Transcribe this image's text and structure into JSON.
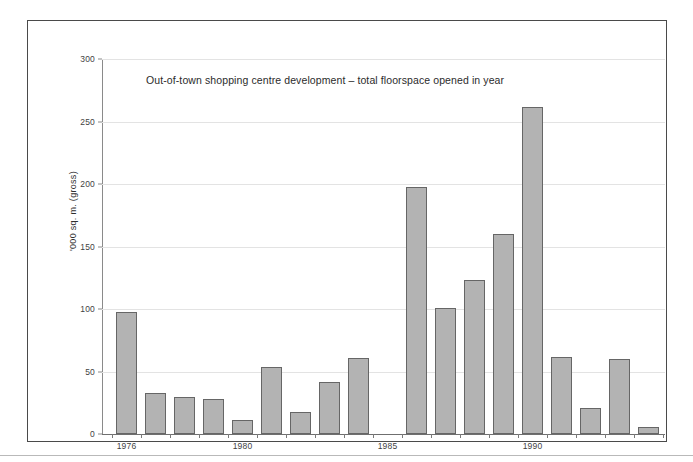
{
  "figure": {
    "frame_border_color": "#4a4a4a",
    "background_color": "#ffffff"
  },
  "chart_data": {
    "type": "bar",
    "title": "Out-of-town shopping centre development – total floorspace opened in year",
    "xlabel": "",
    "ylabel": "'000 sq. m. (gross)",
    "ylim": [
      0,
      300
    ],
    "ytick_labels": [
      "0",
      "50",
      "100",
      "150",
      "200",
      "250",
      "300"
    ],
    "ytick_values": [
      0,
      50,
      100,
      150,
      200,
      250,
      300
    ],
    "xtick_labels": [
      "1976",
      "1980",
      "1985",
      "1990"
    ],
    "xtick_values": [
      1976,
      1980,
      1985,
      1990
    ],
    "grid": true,
    "legend": "none",
    "bar_fill_color": "#b3b3b3",
    "bar_edge_color": "#666666",
    "gridline_color": "#e3e3e3",
    "categories": [
      "1976",
      "1977",
      "1978",
      "1979",
      "1980",
      "1981",
      "1982",
      "1983",
      "1984",
      "1985",
      "1986",
      "1987",
      "1988",
      "1989",
      "1990",
      "1991",
      "1992",
      "1993",
      "1994"
    ],
    "values": [
      98,
      33,
      30,
      28,
      11,
      54,
      18,
      42,
      61,
      0,
      198,
      101,
      123,
      160,
      262,
      62,
      21,
      60,
      6
    ]
  }
}
